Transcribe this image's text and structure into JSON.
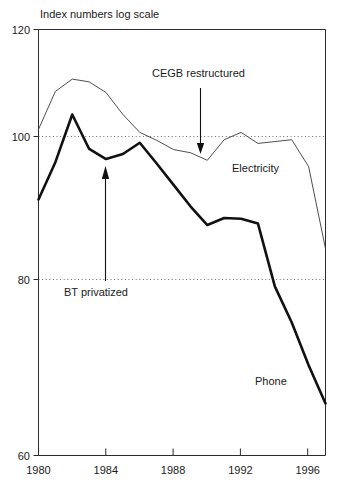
{
  "chart_data": {
    "type": "line",
    "title": "",
    "subtitle": "",
    "ylabel": "Index numbers log scale",
    "xlabel": "",
    "yscale": "log",
    "ylim": [
      60,
      120
    ],
    "xlim": [
      1980,
      1997
    ],
    "grid": "dotted horizontal gridlines at 100 and 80",
    "legend_position": "inline labels on series",
    "yticks": [
      {
        "value": 120,
        "label": "120"
      },
      {
        "value": 100,
        "label": "100"
      },
      {
        "value": 80,
        "label": "80"
      },
      {
        "value": 60,
        "label": "60"
      }
    ],
    "xticks": [
      {
        "value": 1980,
        "label": "1980"
      },
      {
        "value": 1984,
        "label": "1984"
      },
      {
        "value": 1988,
        "label": "1988"
      },
      {
        "value": 1992,
        "label": "1992"
      },
      {
        "value": 1996,
        "label": "1996"
      }
    ],
    "gridlines": [
      100,
      80
    ],
    "x": [
      1980,
      1981,
      1982,
      1983,
      1984,
      1985,
      1986,
      1987,
      1988,
      1989,
      1990,
      1991,
      1992,
      1993,
      1994,
      1995,
      1996,
      1997
    ],
    "series": [
      {
        "name": "Electricity",
        "style": "thin",
        "values": [
          102.0,
          108.5,
          110.7,
          110.2,
          108.3,
          104.5,
          101.5,
          100.2,
          98.7,
          98.2,
          97.0,
          100.3,
          101.5,
          99.7,
          100.0,
          100.3,
          96.0,
          84.0
        ]
      },
      {
        "name": "Phone",
        "style": "thick",
        "values": [
          91.0,
          96.7,
          104.5,
          98.8,
          97.2,
          98.0,
          99.8,
          96.5,
          93.2,
          90.0,
          87.3,
          88.3,
          88.2,
          87.5,
          79.0,
          74.5,
          69.5,
          65.3
        ]
      }
    ],
    "series_labels": [
      {
        "name": "Electricity",
        "text": "Electricity"
      },
      {
        "name": "Phone",
        "text": "Phone"
      }
    ],
    "annotations": [
      {
        "id": "cegb",
        "text": "CEGB restructured",
        "points_to_year": 1990,
        "points_to_value": 97.0,
        "arrow_direction": "down"
      },
      {
        "id": "bt",
        "text": "BT privatized",
        "points_to_year": 1984,
        "points_to_value": 97.2,
        "arrow_direction": "up"
      }
    ]
  },
  "axis": {
    "caption": "Index numbers log scale"
  }
}
